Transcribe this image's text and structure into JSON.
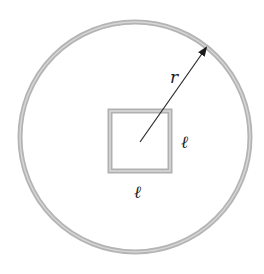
{
  "figure": {
    "labels": {
      "radius": "r",
      "side_right": "ℓ",
      "side_bottom": "ℓ"
    },
    "shapes": {
      "circle": {
        "cx": 135,
        "cy": 137,
        "r": 115,
        "stroke": "#a8a8a8"
      },
      "square": {
        "x": 110,
        "y": 111,
        "size": 60,
        "stroke": "#a8a8a8"
      },
      "radius_arrow": {
        "x1": 140,
        "y1": 142,
        "x2": 207,
        "y2": 47,
        "stroke": "#222222"
      }
    }
  }
}
